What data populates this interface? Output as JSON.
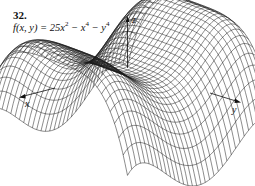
{
  "exercise": {
    "number": "32.",
    "function_prefix": "f(x, y) = 25x",
    "exp1": "2",
    "minus1": " − x",
    "exp2": "4",
    "minus2": " − y",
    "exp3": "4"
  },
  "axes": {
    "x_label": "x",
    "y_label": "y",
    "z_label": "z"
  },
  "figure": {
    "type": "wireframe-surface",
    "function": "25x^2 - x^4 - y^4",
    "line_color": "#1a1a1a"
  }
}
